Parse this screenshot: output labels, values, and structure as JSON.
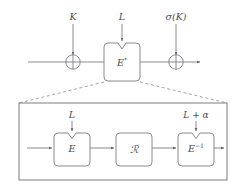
{
  "figure": {
    "name": "tweakable-block-cipher-construction-diagram",
    "colors": {
      "stroke": "#7d7d86",
      "dashed": "#8c8c94",
      "text": "#4a4a52",
      "background": "#ffffff"
    },
    "top_row": {
      "input_label": "",
      "key_label": "K",
      "tweak_label": "L",
      "cipher_label": "E",
      "cipher_superscript": "*",
      "output_key_label": "σ(K)",
      "xor_symbol": "⊕"
    },
    "detail_row": {
      "left_tweak_label": "L",
      "right_tweak_label": "L + α",
      "blocks": [
        {
          "label": "E",
          "superscript": "",
          "name": "encrypt-block"
        },
        {
          "label": "ℛ",
          "superscript": "",
          "name": "round-function-block"
        },
        {
          "label": "E",
          "superscript": "−1",
          "name": "decrypt-block"
        }
      ]
    }
  }
}
